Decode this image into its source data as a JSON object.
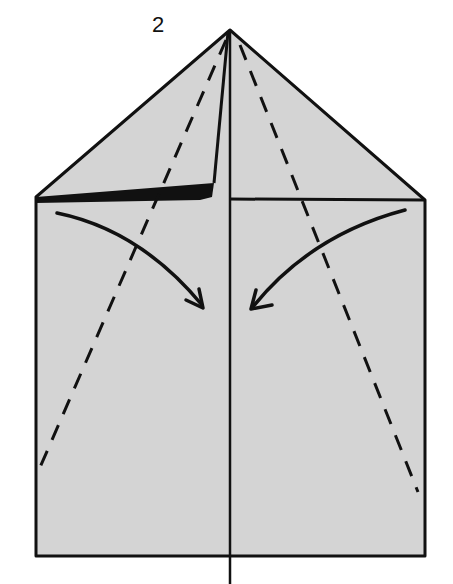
{
  "diagram": {
    "step_number": "2",
    "colors": {
      "paper": "#d4d4d4",
      "line": "#111111",
      "background": "#ffffff"
    },
    "elements": {
      "paper_shape": "square body with triangular top (house shape)",
      "center_line": "vertical crease line down the center",
      "valley_fold_left": "dashed line from apex to lower-left edge",
      "valley_fold_right": "dashed line from apex to lower-right edge",
      "arrow_left": "curved arrow pointing down-right toward center",
      "arrow_right": "curved arrow pointing down-left toward center",
      "folded_flap": "thin black wedge along left top edge showing folded layer"
    }
  }
}
